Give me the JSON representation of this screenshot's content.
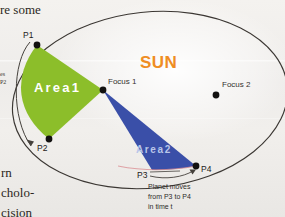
{
  "figure": {
    "title_label": "SUN",
    "title_color": "#ef8d23",
    "background_color": "#f1efec"
  },
  "page_text": {
    "top_fragment": "re  some",
    "left_fragment_line1": "es",
    "left_fragment_line2": "P2",
    "bottom_fragment_line1": "rn",
    "bottom_fragment_line2": "cholo-",
    "bottom_fragment_line3": "cision"
  },
  "orbit": {
    "shape": "ellipse",
    "center_x": 150,
    "center_y": 100,
    "radius_x": 138,
    "radius_y": 88,
    "rotation_deg": -6,
    "stroke_color": "#3b3733"
  },
  "foci": [
    {
      "name": "Focus 1",
      "label": "Focus 1",
      "x": 103,
      "y": 90,
      "label_x": 108,
      "label_y": 82
    },
    {
      "name": "Focus 2",
      "label": "Focus 2",
      "x": 216,
      "y": 95,
      "label_x": 222,
      "label_y": 85
    }
  ],
  "orbit_points": [
    {
      "name": "P1",
      "label": "P1",
      "x": 37,
      "y": 45,
      "label_x": 24,
      "label_y": 34
    },
    {
      "name": "P2",
      "label": "P2",
      "x": 49,
      "y": 139,
      "label_x": 38,
      "label_y": 147
    },
    {
      "name": "P3",
      "label": "P3",
      "x": 152,
      "y": 170,
      "label_x": 139,
      "label_y": 173
    },
    {
      "name": "P4",
      "label": "P4",
      "x": 196,
      "y": 166,
      "label_x": 202,
      "label_y": 170
    }
  ],
  "areas": [
    {
      "name": "Area1",
      "label": "Area1",
      "fill_color": "#8cbe2a",
      "label_x": 34,
      "label_y": 87,
      "swept_from": "P1",
      "swept_to": "P2"
    },
    {
      "name": "Area2",
      "label": "Area2",
      "fill_color": "#3a4fa8",
      "label_x": 136,
      "label_y": 150,
      "swept_from": "P3",
      "swept_to": "P4"
    }
  ],
  "annotation": {
    "line1": "Planet moves",
    "line2": "from P3 to P4",
    "line3": "in time t",
    "x": 148,
    "y": 183
  },
  "arrows": [
    {
      "name": "arrow-p1-to-p2",
      "from": "P1",
      "to": "P2",
      "side": "left"
    },
    {
      "name": "arrow-p3-to-p4",
      "from": "P3",
      "to": "P4",
      "side": "bottom"
    }
  ]
}
